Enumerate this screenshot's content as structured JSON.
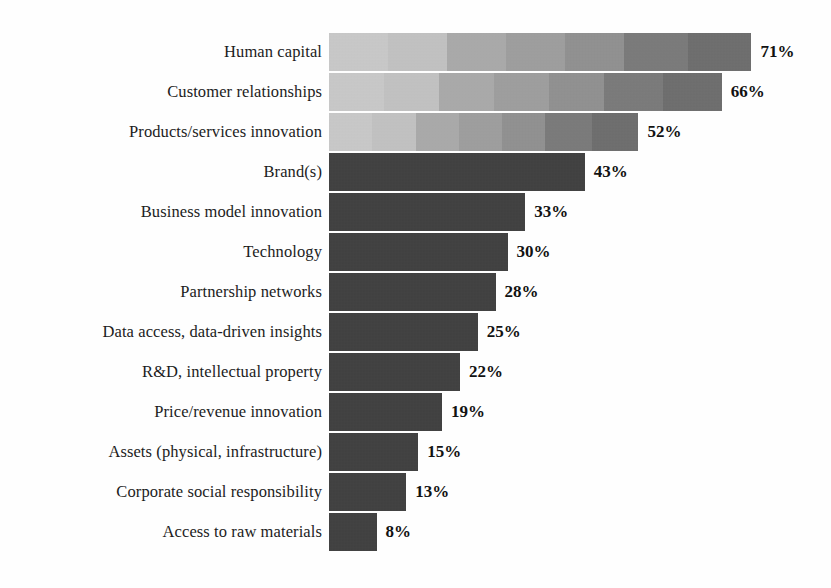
{
  "chart_data": {
    "type": "bar",
    "orientation": "horizontal",
    "title": "",
    "subtitle": "",
    "xlabel": "",
    "ylabel": "",
    "grid": false,
    "legend": null,
    "axis_visible": false,
    "value_suffix": "%",
    "xlim": [
      0,
      71
    ],
    "categories": [
      "Human capital",
      "Customer relationships",
      "Products/services innovation",
      "Brand(s)",
      "Business model innovation",
      "Technology",
      "Partnership networks",
      "Data access, data-driven insights",
      "R&D, intellectual property",
      "Price/revenue innovation",
      "Assets (physical, infrastructure)",
      "Corporate social responsibility",
      "Access to raw materials"
    ],
    "values": [
      71,
      66,
      52,
      43,
      33,
      30,
      28,
      25,
      22,
      19,
      15,
      13,
      8
    ],
    "value_labels": [
      "71%",
      "66%",
      "52%",
      "43%",
      "33%",
      "30%",
      "28%",
      "25%",
      "22%",
      "19%",
      "15%",
      "13%",
      "8%"
    ],
    "bar_styles": [
      "gradient",
      "gradient",
      "gradient",
      "solid",
      "solid",
      "solid",
      "solid",
      "solid",
      "solid",
      "solid",
      "solid",
      "solid",
      "solid"
    ],
    "colors": {
      "solid_bar": "#3c3c3c",
      "gradient_start": "#c9c9c9",
      "gradient_end": "#6b6b6b",
      "label_text": "#1c1c1c",
      "value_text": "#121212",
      "background": "#fefefe"
    },
    "scale_px_per_unit": 5.95
  }
}
